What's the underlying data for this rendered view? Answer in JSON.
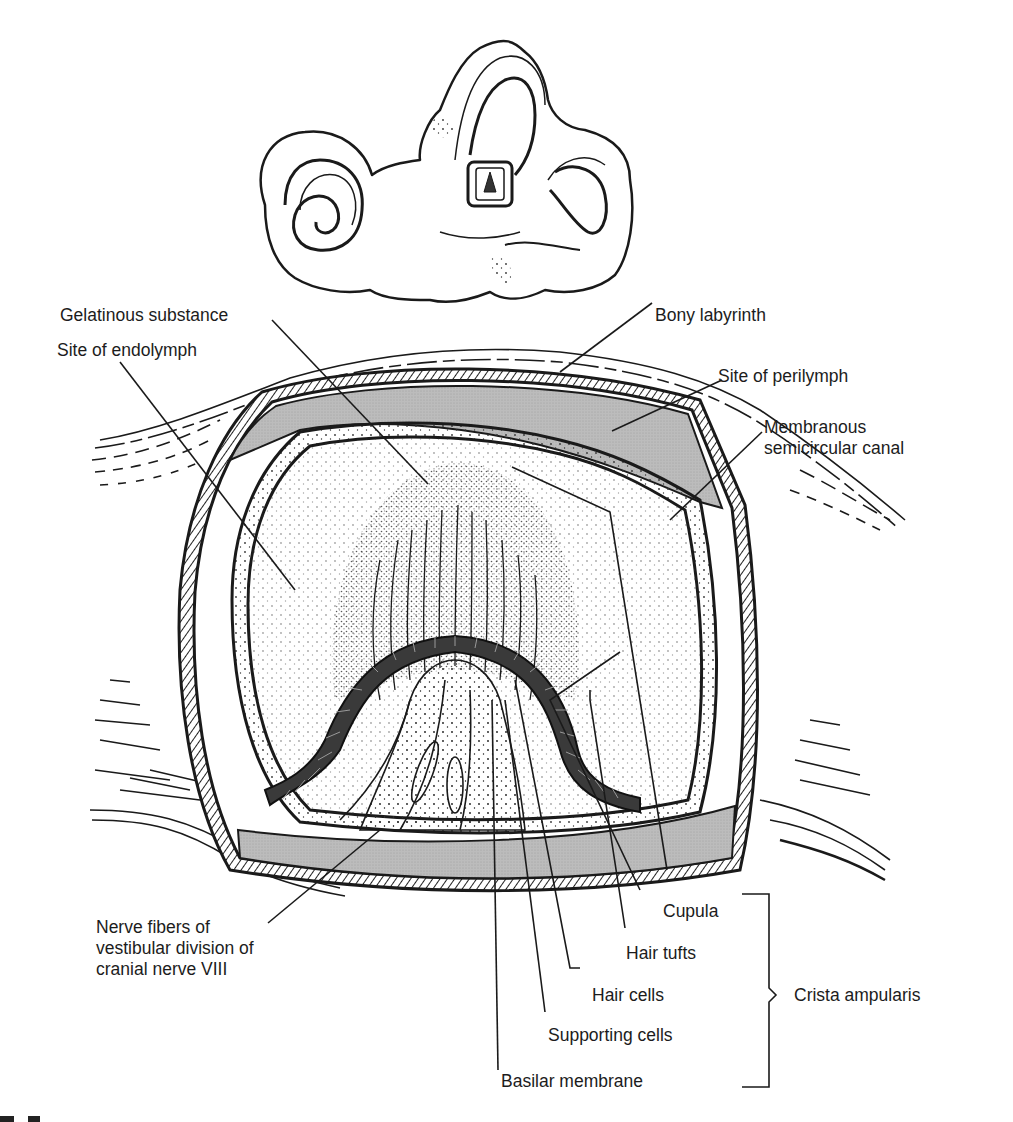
{
  "figure": {
    "inset": "inner-ear-labyrinth-overview",
    "colors": {
      "ink": "#1a1a1a",
      "perilymph_fill": "#b4b4b4",
      "hair_cell_fill": "#3a3a3a",
      "background": "#ffffff"
    }
  },
  "labels": {
    "gelatinous_substance": "Gelatinous substance",
    "bony_labyrinth": "Bony labyrinth",
    "site_of_endolymph": "Site of endolymph",
    "site_of_perilymph": "Site of perilymph",
    "membranous_canal": [
      "Membranous",
      "semicircular canal"
    ],
    "nerve_fibers": [
      "Nerve fibers of",
      "vestibular division of",
      "cranial nerve VIII"
    ],
    "cupula": "Cupula",
    "hair_tufts": "Hair tufts",
    "hair_cells": "Hair cells",
    "supporting_cells": "Supporting cells",
    "basilar_membrane": "Basilar membrane",
    "crista_ampularis": "Crista ampularis"
  }
}
